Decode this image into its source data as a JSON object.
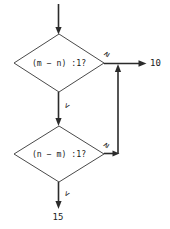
{
  "diagram": {
    "type": "flowchart",
    "background_color": "#ffffff",
    "line_color": "#2b2b2b",
    "shape_stroke_color": "#4a4a4a",
    "text_color": "#1a1a1a",
    "nodes": [
      {
        "id": "decision-1",
        "shape": "diamond",
        "text": "(m − n) :1?",
        "cx": 59,
        "cy": 63,
        "rx": 45,
        "ry": 29
      },
      {
        "id": "decision-2",
        "shape": "diamond",
        "text": "(n − m) :1?",
        "cx": 59,
        "cy": 154,
        "rx": 45,
        "ry": 28
      }
    ],
    "branch_labels": {
      "decision1_ge": "≥",
      "decision1_lt": "<",
      "decision2_ge": "≥",
      "decision2_lt": "<"
    },
    "targets": {
      "ten": "10",
      "fifteen": "15"
    }
  }
}
